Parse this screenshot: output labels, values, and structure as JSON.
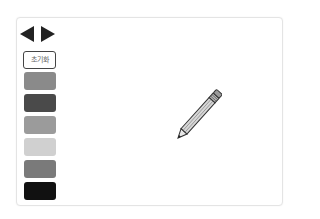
{
  "toolbar": {
    "prev_icon": "triangle-left-icon",
    "next_icon": "triangle-right-icon",
    "reset_label": "초기화"
  },
  "palette": {
    "swatches": [
      {
        "name": "gray",
        "color": "#8a8a8a"
      },
      {
        "name": "dark-gray",
        "color": "#4a4a4a"
      },
      {
        "name": "medium-gray",
        "color": "#9b9b9b"
      },
      {
        "name": "light-gray",
        "color": "#d0d0d0"
      },
      {
        "name": "slate-gray",
        "color": "#7a7a7a"
      },
      {
        "name": "black",
        "color": "#111111"
      }
    ]
  },
  "canvas": {
    "cursor_icon": "pencil-icon"
  }
}
